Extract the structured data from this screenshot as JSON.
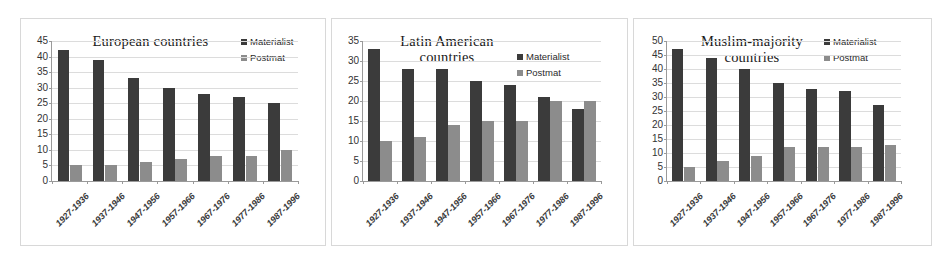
{
  "figure": {
    "background": "#ffffff",
    "series_colors": {
      "materialist": "#3b3b3b",
      "postmat": "#8c8c8c"
    },
    "legend_labels": {
      "materialist": "Materialist",
      "postmat": "Postmat"
    }
  },
  "panels": [
    {
      "id": "europe",
      "title": "European countries"
    },
    {
      "id": "latin",
      "title": "Latin American\ncountries"
    },
    {
      "id": "muslim",
      "title": "Muslim-majority\ncountries"
    }
  ],
  "chart_data": [
    {
      "type": "bar",
      "title": "European countries",
      "xlabel": "",
      "ylabel": "",
      "ylim": [
        0,
        45
      ],
      "yticks": [
        0,
        5,
        10,
        15,
        20,
        25,
        30,
        35,
        40,
        45
      ],
      "grid": true,
      "legend_position": "top-right",
      "categories": [
        "1927-1936",
        "1937-1946",
        "1947-1956",
        "1957-1966",
        "1967-1976",
        "1977-1986",
        "1987-1996"
      ],
      "series": [
        {
          "name": "Materialist",
          "color": "#3b3b3b",
          "values": [
            42,
            39,
            33,
            30,
            28,
            27,
            25
          ]
        },
        {
          "name": "Postmat",
          "color": "#8c8c8c",
          "values": [
            5,
            5,
            6,
            7,
            8,
            8,
            10
          ]
        }
      ]
    },
    {
      "type": "bar",
      "title": "Latin American countries",
      "xlabel": "",
      "ylabel": "",
      "ylim": [
        0,
        35
      ],
      "yticks": [
        0,
        5,
        10,
        15,
        20,
        25,
        30,
        35
      ],
      "grid": true,
      "legend_position": "top-right",
      "categories": [
        "1927-1936",
        "1937-1946",
        "1947-1956",
        "1957-1966",
        "1967-1976",
        "1977-1986",
        "1987-1996"
      ],
      "series": [
        {
          "name": "Materialist",
          "color": "#3b3b3b",
          "values": [
            33,
            28,
            28,
            25,
            24,
            21,
            18
          ]
        },
        {
          "name": "Postmat",
          "color": "#8c8c8c",
          "values": [
            10,
            11,
            14,
            15,
            15,
            20,
            20
          ]
        }
      ]
    },
    {
      "type": "bar",
      "title": "Muslim-majority countries",
      "xlabel": "",
      "ylabel": "",
      "ylim": [
        0,
        50
      ],
      "yticks": [
        0,
        5,
        10,
        15,
        20,
        25,
        30,
        35,
        40,
        45,
        50
      ],
      "grid": true,
      "legend_position": "top-right",
      "categories": [
        "1927-1936",
        "1937-1946",
        "1947-1956",
        "1957-1966",
        "1967-1976",
        "1977-1986",
        "1987-1996"
      ],
      "series": [
        {
          "name": "Materialist",
          "color": "#3b3b3b",
          "values": [
            47,
            44,
            40,
            35,
            33,
            32,
            27
          ]
        },
        {
          "name": "Postmat",
          "color": "#8c8c8c",
          "values": [
            5,
            7,
            9,
            12,
            12,
            12,
            13
          ]
        }
      ]
    }
  ]
}
